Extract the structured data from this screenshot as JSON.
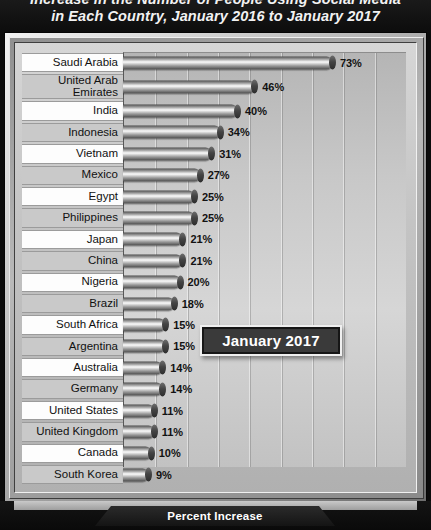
{
  "title": {
    "line1": "Increase in the Number of People Using Social Media",
    "line2": "in Each Country, January 2016 to January 2017"
  },
  "callout": {
    "label": "January 2017"
  },
  "axis": {
    "label": "Percent Increase"
  },
  "colors": {
    "background": "#0b0b0b",
    "panel": "#c8c8c8",
    "bar_light": "#f6f6f6",
    "bar_dark": "#4a4a4a",
    "label_row_odd": "#fdfdfd",
    "label_row_even": "#c9c9c9",
    "callout_fill": "#3a3a3a",
    "text": "#111111"
  },
  "chart_data": {
    "type": "bar",
    "orientation": "horizontal",
    "title": "Increase in the Number of People Using Social Media in Each Country, January 2016 to January 2017",
    "xlabel": "Percent Increase",
    "ylabel": "",
    "xlim": [
      0,
      80
    ],
    "grid": true,
    "legend": false,
    "annotations": [
      "January 2017"
    ],
    "value_suffix": "%",
    "categories": [
      "Saudi Arabia",
      "United Arab Emirates",
      "India",
      "Indonesia",
      "Vietnam",
      "Mexico",
      "Egypt",
      "Philippines",
      "Japan",
      "China",
      "Nigeria",
      "Brazil",
      "South Africa",
      "Argentina",
      "Australia",
      "Germany",
      "United States",
      "United Kingdom",
      "Canada",
      "South Korea"
    ],
    "values": [
      73,
      46,
      40,
      34,
      31,
      27,
      25,
      25,
      21,
      21,
      20,
      18,
      15,
      15,
      14,
      14,
      11,
      11,
      10,
      9
    ],
    "labels": [
      "73%",
      "46%",
      "40%",
      "34%",
      "31%",
      "27%",
      "25%",
      "25%",
      "21%",
      "21%",
      "20%",
      "18%",
      "15%",
      "15%",
      "14%",
      "14%",
      "11%",
      "11%",
      "10%",
      "9%"
    ]
  }
}
